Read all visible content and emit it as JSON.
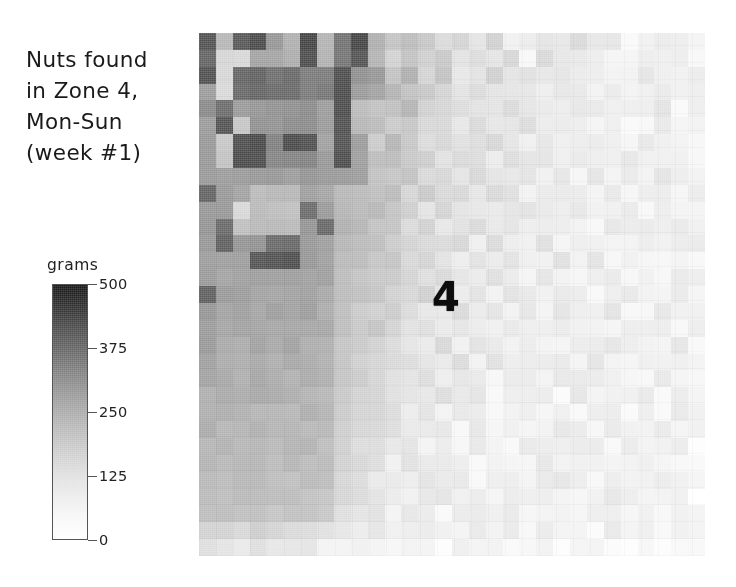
{
  "title": {
    "lines": [
      "Nuts found",
      "in Zone 4,",
      "Mon-Sun",
      "(week #1)"
    ]
  },
  "zone_annotation": "4",
  "colorbar": {
    "label": "grams",
    "ticks": [
      "500",
      "375",
      "250",
      "125",
      "0"
    ],
    "min": 0,
    "max": 500,
    "high_color": "#161616",
    "low_color": "#ffffff"
  },
  "chart_data": {
    "type": "heatmap",
    "title": "Nuts found in Zone 4, Mon-Sun (week #1)",
    "xlabel": "",
    "ylabel": "",
    "colorbar_label": "grams",
    "colorbar_ticks": [
      0,
      125,
      250,
      375,
      500
    ],
    "zlim": [
      0,
      500
    ],
    "colormap": "gray_reversed",
    "grid": false,
    "legend_position": "left",
    "annotations": [
      {
        "text": "4",
        "col": 14,
        "row": 15
      }
    ],
    "n_cols": 30,
    "n_rows": 31,
    "values": [
      [
        330,
        120,
        340,
        360,
        190,
        130,
        370,
        120,
        280,
        370,
        130,
        110,
        110,
        90,
        60,
        70,
        40,
        70,
        25,
        35,
        45,
        30,
        55,
        40,
        25,
        15,
        25,
        20,
        15,
        25
      ],
      [
        300,
        60,
        70,
        160,
        170,
        150,
        350,
        140,
        260,
        350,
        120,
        80,
        110,
        70,
        90,
        50,
        60,
        30,
        60,
        20,
        50,
        25,
        30,
        35,
        15,
        20,
        20,
        25,
        15,
        20
      ],
      [
        340,
        70,
        300,
        300,
        280,
        280,
        260,
        250,
        345,
        200,
        190,
        110,
        130,
        60,
        100,
        45,
        35,
        70,
        40,
        35,
        30,
        45,
        25,
        30,
        20,
        25,
        30,
        20,
        20,
        15
      ],
      [
        190,
        60,
        300,
        300,
        300,
        290,
        250,
        250,
        350,
        190,
        170,
        140,
        110,
        90,
        65,
        50,
        55,
        50,
        30,
        40,
        25,
        30,
        40,
        25,
        30,
        20,
        15,
        25,
        20,
        20
      ],
      [
        220,
        280,
        180,
        200,
        210,
        215,
        215,
        180,
        345,
        120,
        95,
        100,
        120,
        80,
        55,
        60,
        45,
        35,
        45,
        30,
        35,
        30,
        25,
        35,
        20,
        25,
        20,
        30,
        15,
        20
      ],
      [
        190,
        340,
        95,
        205,
        210,
        215,
        210,
        175,
        340,
        115,
        110,
        85,
        90,
        70,
        60,
        45,
        55,
        40,
        30,
        45,
        20,
        35,
        30,
        20,
        25,
        15,
        20,
        25,
        15,
        20
      ],
      [
        185,
        90,
        355,
        355,
        230,
        350,
        350,
        180,
        350,
        190,
        80,
        120,
        100,
        60,
        70,
        50,
        40,
        55,
        35,
        25,
        40,
        25,
        20,
        30,
        25,
        20,
        30,
        15,
        25,
        20
      ],
      [
        180,
        95,
        355,
        355,
        225,
        240,
        245,
        180,
        345,
        185,
        105,
        110,
        85,
        75,
        45,
        65,
        50,
        30,
        40,
        35,
        30,
        20,
        35,
        25,
        15,
        30,
        20,
        20,
        25,
        15
      ],
      [
        175,
        180,
        190,
        195,
        195,
        185,
        190,
        175,
        180,
        175,
        110,
        95,
        95,
        55,
        60,
        40,
        60,
        45,
        25,
        30,
        25,
        40,
        20,
        30,
        20,
        25,
        15,
        30,
        20,
        25
      ],
      [
        300,
        185,
        175,
        120,
        120,
        125,
        165,
        170,
        130,
        115,
        100,
        120,
        70,
        85,
        50,
        55,
        35,
        50,
        40,
        20,
        35,
        25,
        30,
        20,
        30,
        15,
        25,
        20,
        15,
        20
      ],
      [
        195,
        180,
        60,
        110,
        120,
        110,
        295,
        175,
        125,
        110,
        120,
        90,
        80,
        45,
        65,
        35,
        45,
        30,
        35,
        45,
        25,
        20,
        35,
        25,
        20,
        30,
        20,
        25,
        15,
        20
      ],
      [
        185,
        300,
        105,
        110,
        115,
        120,
        185,
        290,
        130,
        120,
        95,
        105,
        60,
        70,
        40,
        50,
        55,
        25,
        30,
        35,
        20,
        30,
        25,
        15,
        35,
        20,
        25,
        15,
        20,
        15
      ],
      [
        190,
        300,
        185,
        190,
        300,
        300,
        185,
        170,
        130,
        115,
        105,
        85,
        75,
        55,
        50,
        60,
        30,
        45,
        20,
        25,
        40,
        20,
        30,
        25,
        20,
        15,
        30,
        20,
        25,
        20
      ],
      [
        180,
        180,
        185,
        345,
        345,
        345,
        180,
        175,
        125,
        110,
        90,
        100,
        65,
        60,
        45,
        35,
        50,
        30,
        35,
        20,
        25,
        35,
        20,
        30,
        15,
        25,
        20,
        15,
        25,
        15
      ],
      [
        175,
        175,
        180,
        180,
        175,
        175,
        170,
        165,
        120,
        105,
        100,
        80,
        70,
        50,
        55,
        40,
        25,
        45,
        30,
        20,
        30,
        25,
        15,
        20,
        25,
        20,
        30,
        15,
        20,
        20
      ],
      [
        300,
        175,
        170,
        170,
        165,
        170,
        165,
        160,
        115,
        100,
        95,
        75,
        55,
        65,
        35,
        30,
        45,
        25,
        40,
        30,
        20,
        25,
        30,
        15,
        20,
        25,
        15,
        20,
        25,
        15
      ],
      [
        185,
        170,
        175,
        165,
        170,
        165,
        170,
        155,
        120,
        95,
        85,
        90,
        60,
        45,
        40,
        50,
        30,
        35,
        25,
        45,
        15,
        30,
        20,
        25,
        30,
        15,
        20,
        25,
        15,
        20
      ],
      [
        175,
        165,
        160,
        170,
        160,
        165,
        160,
        150,
        110,
        90,
        100,
        70,
        50,
        55,
        30,
        40,
        35,
        20,
        30,
        25,
        35,
        20,
        25,
        15,
        20,
        30,
        15,
        20,
        20,
        15
      ],
      [
        180,
        160,
        155,
        160,
        155,
        160,
        155,
        145,
        105,
        95,
        80,
        65,
        45,
        35,
        50,
        25,
        40,
        30,
        20,
        35,
        25,
        15,
        30,
        20,
        25,
        15,
        20,
        15,
        25,
        15
      ],
      [
        165,
        155,
        150,
        155,
        150,
        150,
        150,
        140,
        100,
        85,
        75,
        60,
        55,
        40,
        30,
        45,
        20,
        35,
        25,
        30,
        20,
        25,
        15,
        30,
        15,
        20,
        25,
        15,
        20,
        15
      ],
      [
        160,
        150,
        145,
        150,
        145,
        145,
        145,
        135,
        95,
        80,
        70,
        55,
        40,
        50,
        25,
        30,
        35,
        20,
        30,
        25,
        15,
        35,
        20,
        25,
        15,
        20,
        15,
        25,
        15,
        20
      ],
      [
        150,
        145,
        140,
        145,
        140,
        140,
        140,
        130,
        90,
        75,
        65,
        50,
        45,
        30,
        40,
        25,
        30,
        15,
        25,
        20,
        30,
        15,
        25,
        20,
        15,
        25,
        20,
        15,
        20,
        15
      ],
      [
        145,
        140,
        135,
        140,
        135,
        135,
        135,
        125,
        85,
        70,
        60,
        45,
        35,
        40,
        20,
        30,
        25,
        20,
        15,
        30,
        20,
        25,
        15,
        20,
        25,
        15,
        20,
        15,
        25,
        15
      ],
      [
        140,
        135,
        130,
        135,
        130,
        130,
        130,
        120,
        80,
        65,
        55,
        40,
        30,
        35,
        25,
        20,
        30,
        15,
        25,
        20,
        15,
        25,
        20,
        15,
        20,
        25,
        15,
        20,
        15,
        10
      ],
      [
        135,
        130,
        125,
        130,
        125,
        125,
        125,
        115,
        75,
        60,
        50,
        35,
        40,
        25,
        30,
        15,
        25,
        20,
        15,
        30,
        20,
        15,
        25,
        20,
        15,
        20,
        25,
        15,
        20,
        10
      ],
      [
        130,
        125,
        120,
        125,
        120,
        120,
        120,
        110,
        70,
        55,
        45,
        30,
        35,
        20,
        25,
        30,
        15,
        25,
        20,
        15,
        25,
        20,
        15,
        25,
        20,
        15,
        20,
        15,
        10,
        10
      ],
      [
        125,
        120,
        115,
        120,
        115,
        115,
        115,
        105,
        65,
        50,
        40,
        35,
        25,
        30,
        20,
        25,
        15,
        20,
        25,
        15,
        20,
        25,
        15,
        20,
        15,
        25,
        15,
        20,
        10,
        10
      ],
      [
        120,
        115,
        110,
        115,
        110,
        110,
        110,
        100,
        60,
        45,
        40,
        30,
        20,
        25,
        30,
        15,
        25,
        20,
        15,
        20,
        25,
        15,
        20,
        15,
        25,
        15,
        20,
        10,
        15,
        10
      ],
      [
        115,
        110,
        105,
        110,
        105,
        105,
        105,
        95,
        55,
        40,
        35,
        25,
        30,
        20,
        15,
        25,
        20,
        15,
        25,
        15,
        20,
        20,
        15,
        25,
        15,
        20,
        10,
        15,
        10,
        10
      ],
      [
        70,
        65,
        60,
        70,
        60,
        60,
        60,
        55,
        45,
        35,
        30,
        25,
        20,
        30,
        15,
        20,
        25,
        15,
        20,
        15,
        25,
        15,
        20,
        15,
        20,
        10,
        15,
        10,
        10,
        8
      ],
      [
        40,
        35,
        30,
        40,
        30,
        30,
        30,
        25,
        25,
        20,
        15,
        20,
        15,
        20,
        10,
        15,
        20,
        10,
        15,
        10,
        20,
        10,
        15,
        10,
        15,
        8,
        10,
        8,
        8,
        5
      ]
    ]
  }
}
